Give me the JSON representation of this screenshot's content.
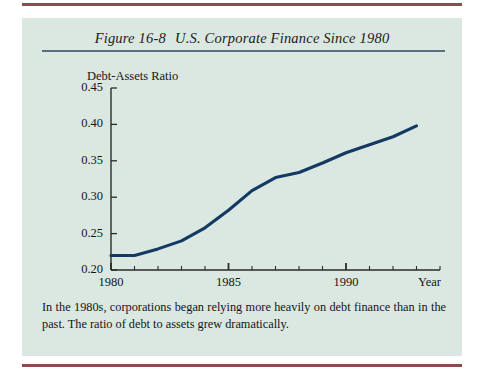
{
  "figure": {
    "number": "Figure 16-8",
    "title": "U.S. Corporate Finance Since 1980",
    "caption": "In the 1980s, corporations began relying more heavily on debt finance than in the past. The ratio of debt to assets grew dramatically."
  },
  "colors": {
    "panel_background": "#dbe7e1",
    "page_background": "#ffffff",
    "rule_maroon": "#8e4a4f",
    "title_rule_blue": "#5a6d82",
    "line_navy": "#123a63",
    "axis": "#2b2b2b",
    "text": "#161616"
  },
  "chart_data": {
    "type": "line",
    "title": "U.S. Corporate Finance Since 1980",
    "xlabel": "Year",
    "ylabel": "Debt-Assets Ratio",
    "xlim": [
      1980,
      1994
    ],
    "ylim": [
      0.2,
      0.45
    ],
    "grid": false,
    "legend": null,
    "y_ticks": [
      0.2,
      0.25,
      0.3,
      0.35,
      0.4,
      0.45
    ],
    "y_tick_labels": [
      "0.20",
      "0.25",
      "0.30",
      "0.35",
      "0.40",
      "0.45"
    ],
    "x_major_ticks": [
      1980,
      1985,
      1990
    ],
    "x_tick_labels": [
      "1980",
      "1985",
      "1990"
    ],
    "x_minor_tick_interval": 1,
    "x": [
      1980,
      1981,
      1982,
      1983,
      1984,
      1985,
      1986,
      1987,
      1988,
      1989,
      1990,
      1991,
      1992,
      1993
    ],
    "y": [
      0.22,
      0.22,
      0.229,
      0.24,
      0.258,
      0.282,
      0.309,
      0.327,
      0.334,
      0.347,
      0.361,
      0.372,
      0.383,
      0.398
    ],
    "series": [
      {
        "name": "Debt-Assets Ratio",
        "values": [
          0.22,
          0.22,
          0.229,
          0.24,
          0.258,
          0.282,
          0.309,
          0.327,
          0.334,
          0.347,
          0.361,
          0.372,
          0.383,
          0.398
        ]
      }
    ]
  }
}
